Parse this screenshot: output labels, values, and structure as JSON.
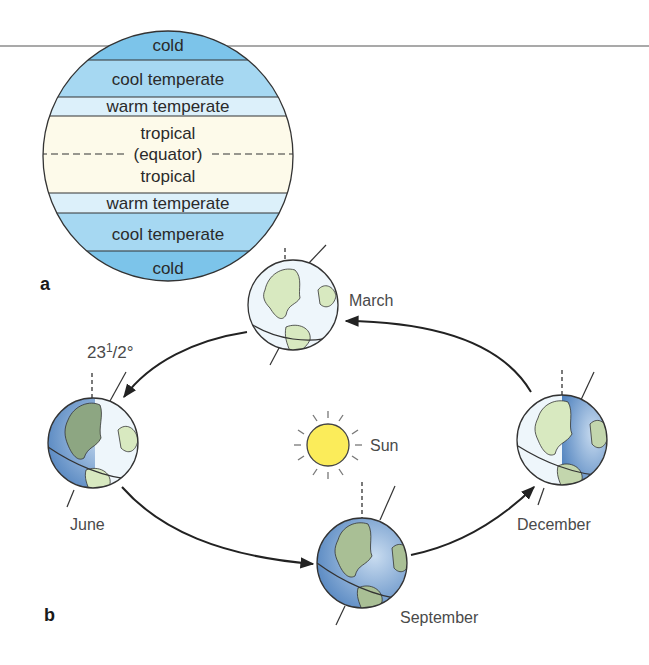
{
  "panel_a": {
    "label": "a",
    "bands": [
      {
        "name": "cold",
        "label": "cold",
        "color": "#7cc4ea"
      },
      {
        "name": "cool-temperate",
        "label": "cool temperate",
        "color": "#a6d8f2"
      },
      {
        "name": "warm-temperate",
        "label": "warm temperate",
        "color": "#dcf0fa"
      },
      {
        "name": "tropical-north",
        "label": "tropical",
        "color": "#fdfaea"
      },
      {
        "name": "equator",
        "label": "(equator)"
      },
      {
        "name": "tropical-south",
        "label": "tropical",
        "color": "#fdfaea"
      },
      {
        "name": "warm-temperate-south",
        "label": "warm temperate",
        "color": "#dcf0fa"
      },
      {
        "name": "cool-temperate-south",
        "label": "cool temperate",
        "color": "#a6d8f2"
      },
      {
        "name": "cold-south",
        "label": "cold",
        "color": "#7cc4ea"
      }
    ]
  },
  "panel_b": {
    "label": "b",
    "tilt_label_main": "23",
    "tilt_label_sup": "1",
    "tilt_label_rest": "/2°",
    "sun_label": "Sun",
    "months": {
      "march": "March",
      "june": "June",
      "september": "September",
      "december": "December"
    }
  },
  "colors": {
    "sun_fill": "#fbec5a",
    "ocean_lit": "#eef6fb",
    "ocean_dark": "#5e90c6",
    "land": "#d8e9c0",
    "land_dark": "#8da682",
    "line": "#222222"
  }
}
